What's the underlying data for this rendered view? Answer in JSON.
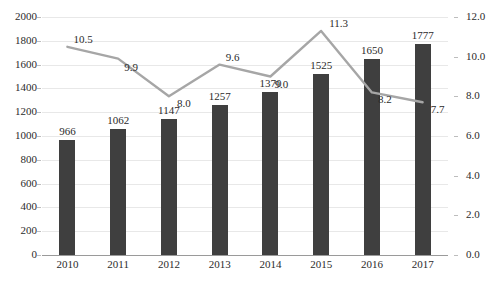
{
  "chart_data": {
    "type": "bar",
    "title": "",
    "subtitle": "",
    "xlabel": "",
    "ylabel": "",
    "y2label": "",
    "grid": true,
    "legend_position": "none",
    "categories": [
      "2010",
      "2011",
      "2012",
      "2013",
      "2014",
      "2015",
      "2016",
      "2017"
    ],
    "ylim": [
      0,
      2000
    ],
    "y2lim": [
      0,
      12
    ],
    "yticks": [
      0,
      200,
      400,
      600,
      800,
      1000,
      1200,
      1400,
      1600,
      1800,
      2000
    ],
    "ytick_labels": [
      "0",
      "200",
      "400",
      "600",
      "800",
      "1000",
      "1200",
      "1400",
      "1600",
      "1800",
      "2000"
    ],
    "y2ticks": [
      0,
      2,
      4,
      6,
      8,
      10,
      12
    ],
    "y2tick_labels": [
      "0.0",
      "2.0",
      "4.0",
      "6.0",
      "8.0",
      "10.0",
      "12.0"
    ],
    "series": [
      {
        "name": "bars",
        "type": "bar",
        "axis": "left",
        "color": "#3f3f3f",
        "values": [
          966,
          1062,
          1147,
          1257,
          1370,
          1525,
          1650,
          1777
        ],
        "labels": [
          "966",
          "1062",
          "1147",
          "1257",
          "1370",
          "1525",
          "1650",
          "1777"
        ]
      },
      {
        "name": "line",
        "type": "line",
        "axis": "right",
        "color": "#a6a6a6",
        "values": [
          10.5,
          9.9,
          8.0,
          9.6,
          9.0,
          11.3,
          8.2,
          7.7
        ],
        "labels": [
          "10.5",
          "9.9",
          "8.0",
          "9.6",
          "9.0",
          "11.3",
          "8.2",
          "7.7"
        ]
      }
    ]
  },
  "footer": {
    "source_note": ""
  },
  "colors": {
    "bar": "#3f3f3f",
    "line": "#a6a6a6",
    "grid": "#e8e8e8",
    "axis": "#9a9a9a",
    "text": "#2b2b2b",
    "background": "#ffffff"
  }
}
